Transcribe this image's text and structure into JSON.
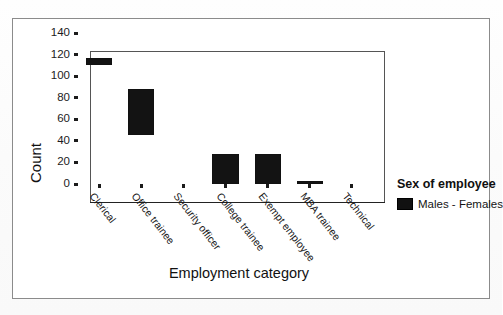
{
  "chart_data": {
    "type": "bar",
    "title": "",
    "subtitle": "",
    "xlabel": "Employment category",
    "ylabel": "Count",
    "categories": [
      "Clerical",
      "Office trainee",
      "Security officer",
      "College trainee",
      "Exempt employee",
      "MBA trainee",
      "Technical"
    ],
    "series": [
      {
        "name": "Males - Females",
        "type": "range",
        "low": [
          110,
          45,
          0,
          0,
          0,
          0,
          0
        ],
        "high": [
          117,
          88,
          0,
          28,
          28,
          3,
          0
        ],
        "values": [
          117,
          88,
          0,
          28,
          28,
          3,
          0
        ]
      }
    ],
    "ylim": [
      0,
      140
    ],
    "yticks": [
      0,
      20,
      40,
      60,
      80,
      100,
      120,
      140
    ],
    "ytick_labels": [
      "0",
      "20",
      "40",
      "60",
      "80",
      "100",
      "120",
      "140"
    ],
    "grid": false,
    "legend_position": "right",
    "legend": {
      "title": "Sex of employee",
      "entries": [
        "Males - Females"
      ]
    },
    "bar_color": "#131313"
  },
  "legend": {
    "title": "Sex of employee",
    "entry_label": "Males - Females"
  },
  "axes": {
    "y_title": "Count",
    "x_title": "Employment category"
  }
}
